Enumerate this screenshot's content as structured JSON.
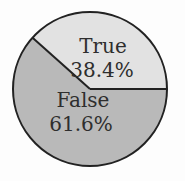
{
  "chart_data": {
    "type": "pie",
    "title": "",
    "categories": [
      "True",
      "False"
    ],
    "values": [
      38.4,
      61.6
    ],
    "unit": "%",
    "labels": [
      "True\n38.4%",
      "False\n61.6%"
    ],
    "colors": [
      "#e2e2e2",
      "#b9b9b9"
    ],
    "start_angle_deg": 0,
    "direction": "counterclockwise",
    "legend": "none",
    "edge_color": "#222222"
  },
  "slices": [
    {
      "name": "True",
      "percent_label": "38.4%",
      "color": "#e2e2e2"
    },
    {
      "name": "False",
      "percent_label": "61.6%",
      "color": "#b9b9b9"
    }
  ]
}
